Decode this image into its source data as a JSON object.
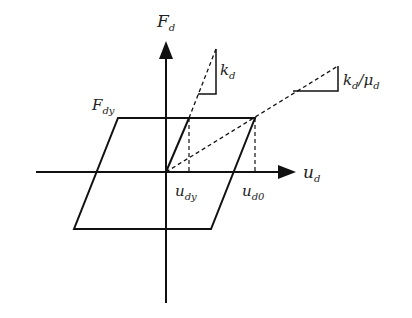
{
  "diagram": {
    "type": "hysteresis-loop",
    "colors": {
      "stroke": "#111111",
      "background": "#ffffff"
    },
    "axes": {
      "y_label": {
        "main": "F",
        "sub": "d"
      },
      "x_label": {
        "main": "u",
        "sub": "d"
      }
    },
    "labels": {
      "yield_force": {
        "main": "F",
        "sub": "dy"
      },
      "yield_disp": {
        "main": "u",
        "sub": "dy"
      },
      "max_disp": {
        "main": "u",
        "sub": "d0"
      },
      "initial_stiffness": {
        "main": "k",
        "sub": "d"
      },
      "effective_stiffness": {
        "main": "k",
        "sub": "d",
        "sep": "/",
        "main2": "μ",
        "sub2": "d"
      }
    }
  }
}
